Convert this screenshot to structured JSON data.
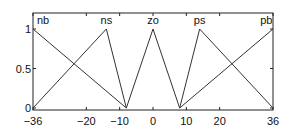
{
  "chart_data": {
    "type": "line",
    "title": "",
    "xlabel": "",
    "ylabel": "",
    "xlim": [
      -37,
      37
    ],
    "ylim": [
      0,
      1.2
    ],
    "grid": false,
    "x_ticks": [
      -36,
      -20,
      -10,
      0,
      10,
      20,
      36
    ],
    "x_tick_labels": [
      "−36",
      "−20",
      "−10",
      "0",
      "10",
      "20",
      "36"
    ],
    "y_ticks": [
      0,
      0.5,
      1
    ],
    "y_tick_labels": [
      "0",
      "0.5",
      "1"
    ],
    "series": [
      {
        "name": "nb",
        "x": [
          -36,
          -8
        ],
        "y": [
          1,
          0
        ]
      },
      {
        "name": "ns",
        "x": [
          -36,
          -14,
          -8
        ],
        "y": [
          0,
          1,
          0
        ]
      },
      {
        "name": "zo",
        "x": [
          -8,
          0,
          8
        ],
        "y": [
          0,
          1,
          0
        ]
      },
      {
        "name": "ps",
        "x": [
          8,
          14,
          36
        ],
        "y": [
          0,
          1,
          0
        ]
      },
      {
        "name": "pb",
        "x": [
          8,
          36
        ],
        "y": [
          0,
          1
        ]
      }
    ],
    "annotations": [
      {
        "text": "nb",
        "x": -33,
        "y": 1.1
      },
      {
        "text": "ns",
        "x": -14,
        "y": 1.1
      },
      {
        "text": "zo",
        "x": 0,
        "y": 1.1
      },
      {
        "text": "ps",
        "x": 14,
        "y": 1.1
      },
      {
        "text": "pb",
        "x": 34,
        "y": 1.1
      }
    ]
  }
}
